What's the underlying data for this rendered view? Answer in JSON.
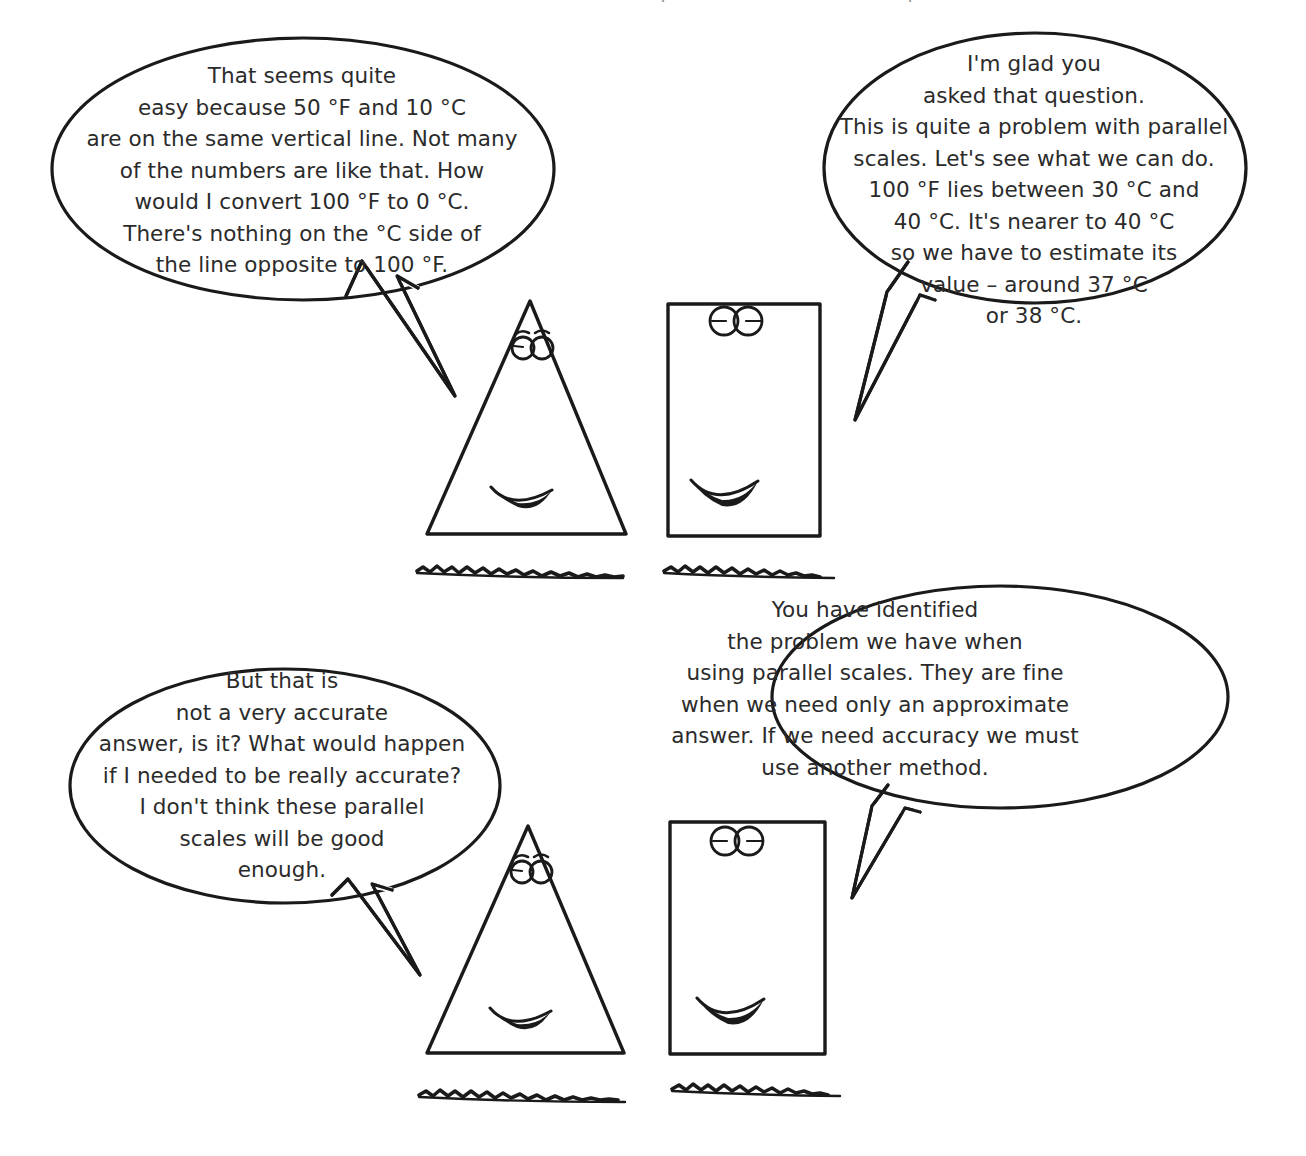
{
  "page": {
    "background_color": "#ffffff",
    "ink_color": "#1a1a1a",
    "text_color": "#2b2b2b",
    "width": 1306,
    "height": 1156
  },
  "bubbles": [
    {
      "id": "bubble-top-left",
      "speaker": "triangle-character-top",
      "tail_direction": "down-right",
      "text": "That seems quite\neasy because 50 °F and 10 °C\nare on the same vertical line. Not many\nof the numbers are like that. How\nwould I convert 100 °F to 0 °C.\nThere's nothing on the °C side of\nthe line opposite to 100 °F."
    },
    {
      "id": "bubble-top-right",
      "speaker": "rectangle-character-top",
      "tail_direction": "down-left",
      "text": "I'm glad you\nasked that question.\nThis is quite a problem with parallel\nscales. Let's see what we can do.\n100 °F lies between 30 °C and\n40 °C. It's nearer to 40 °C\nso we have to estimate its\nvalue – around 37 °C\nor 38 °C."
    },
    {
      "id": "bubble-bottom-left",
      "speaker": "triangle-character-bottom",
      "tail_direction": "down-right",
      "text": "But that is\nnot a very accurate\nanswer, is it? What would happen\nif I needed to be really accurate?\nI don't think these parallel\nscales will be good\nenough."
    },
    {
      "id": "bubble-bottom-right",
      "speaker": "rectangle-character-bottom",
      "tail_direction": "down-left",
      "text": "You have identified\nthe problem we have when\nusing parallel scales. They are fine\nwhen we need only an approximate\nanswer. If we need accuracy we must\nuse another method."
    }
  ],
  "characters": [
    {
      "id": "triangle-character-top",
      "shape": "triangle",
      "expression": "smiling",
      "features": [
        "eyebrows",
        "two-round-eyes",
        "filled-smile"
      ],
      "ground": "scribble-line"
    },
    {
      "id": "rectangle-character-top",
      "shape": "rectangle",
      "expression": "smiling",
      "features": [
        "two-round-eyes-with-bar",
        "filled-smile"
      ],
      "ground": "scribble-line"
    },
    {
      "id": "triangle-character-bottom",
      "shape": "triangle",
      "expression": "smiling",
      "features": [
        "eyebrows",
        "two-round-eyes",
        "filled-smile"
      ],
      "ground": "scribble-line"
    },
    {
      "id": "rectangle-character-bottom",
      "shape": "rectangle",
      "expression": "smiling",
      "features": [
        "two-round-eyes-with-bar",
        "filled-smile"
      ],
      "ground": "scribble-line"
    }
  ],
  "cutoff_text": {
    "top_partial_line": "                                          ı                                      ı"
  }
}
